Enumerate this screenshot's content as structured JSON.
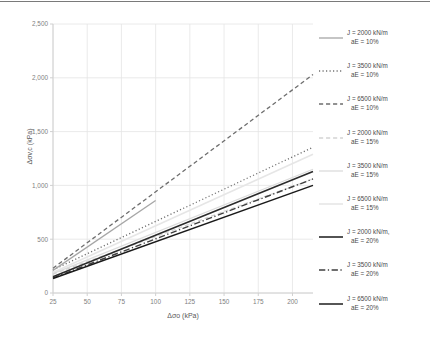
{
  "chart_data": {
    "type": "line",
    "title": "",
    "xlabel": "Δσo (kPa)",
    "ylabel": "Δσv,c (kPa)",
    "xlim": [
      25,
      215
    ],
    "ylim": [
      0,
      2500
    ],
    "xticks": [
      25,
      50,
      75,
      100,
      125,
      150,
      175,
      200
    ],
    "xtick_labels": [
      "25",
      "50",
      "75",
      "100",
      "125",
      "150",
      "175",
      "200"
    ],
    "yticks": [
      0,
      500,
      1000,
      1500,
      2000,
      2500
    ],
    "ytick_labels": [
      "0",
      "500",
      "1,000",
      "1,500",
      "2,000",
      "2,500"
    ],
    "grid": true,
    "legend_position": "right",
    "series": [
      {
        "name": "J = 2000 kN/m, aE = 10%",
        "label_line1": "J = 2000 kN/m",
        "label_line2": "aE = 10%",
        "style": "solid",
        "color": "#A6A6A6",
        "width": 1.3,
        "x": [
          25,
          100
        ],
        "y": [
          210,
          860
        ]
      },
      {
        "name": "J = 3500 kN/m, aE = 10%",
        "label_line1": "J = 3500 kN/m",
        "label_line2": "aE = 10%",
        "style": "dotted",
        "color": "#6E6E6E",
        "width": 1.3,
        "x": [
          25,
          215
        ],
        "y": [
          215,
          1355
        ]
      },
      {
        "name": "J = 6500 kN/m, aE = 10%",
        "label_line1": "J = 6500 kN/m",
        "label_line2": "aE = 10%",
        "style": "dashed",
        "color": "#6E6E6E",
        "width": 1.3,
        "x": [
          25,
          215
        ],
        "y": [
          230,
          2030
        ]
      },
      {
        "name": "J = 2000 kN/m, aE = 15%",
        "label_line1": "J = 2000 kN/m",
        "label_line2": "aE = 15%",
        "style": "dashed",
        "color": "#D4D4D4",
        "width": 1.3,
        "x": [
          25,
          215
        ],
        "y": [
          175,
          1060
        ]
      },
      {
        "name": "J = 3500 kN/m, aE = 15%",
        "label_line1": "J = 3500 kN/m",
        "label_line2": "aE = 15%",
        "style": "solid",
        "color": "#DCDCDC",
        "width": 1.3,
        "x": [
          25,
          215
        ],
        "y": [
          180,
          1150
        ]
      },
      {
        "name": "J = 6500 kN/m, aE = 15%",
        "label_line1": "J = 6500 kN/m",
        "label_line2": "aE = 15%",
        "style": "solid",
        "color": "#E6E6E6",
        "width": 1.6,
        "x": [
          25,
          215
        ],
        "y": [
          190,
          1290
        ]
      },
      {
        "name": "J = 2000 kN/m, aE = 20%",
        "label_line1": "J = 2000 kN/m,",
        "label_line2": "aE = 20%",
        "style": "solid",
        "color": "#1A1A1A",
        "width": 1.5,
        "x": [
          25,
          215
        ],
        "y": [
          135,
          1000
        ]
      },
      {
        "name": "J = 3500 kN/m, aE = 20%",
        "label_line1": "J = 3500 kN/m",
        "label_line2": "aE = 20%",
        "style": "dashdot",
        "color": "#3F3F3F",
        "width": 1.4,
        "x": [
          25,
          215
        ],
        "y": [
          140,
          1060
        ]
      },
      {
        "name": "J = 6500 kN/m, aE = 20%",
        "label_line1": "J = 6500 kN/m",
        "label_line2": "aE = 20%",
        "style": "solid",
        "color": "#2B2B2B",
        "width": 1.6,
        "x": [
          25,
          215
        ],
        "y": [
          150,
          1130
        ]
      }
    ]
  },
  "colors": {
    "grid": "#E4E4E4",
    "axis": "#D0D0D0",
    "tick_text": "#808080",
    "axis_title": "#595959",
    "top_border": "#7A7A7A",
    "background": "#FFFFFF"
  }
}
